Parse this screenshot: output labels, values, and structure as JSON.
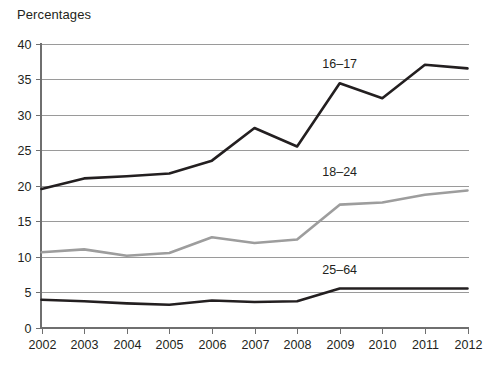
{
  "chart_data": {
    "type": "line",
    "title": "Percentages",
    "xlabel": "",
    "ylabel": "Percentages",
    "x": [
      2002,
      2003,
      2004,
      2005,
      2006,
      2007,
      2008,
      2009,
      2010,
      2011,
      2012
    ],
    "xtick_labels": [
      "2002",
      "2003",
      "2004",
      "2005",
      "2006",
      "2007",
      "2008",
      "2009",
      "2010",
      "2011",
      "2012"
    ],
    "ytick_labels": [
      "0",
      "5",
      "10",
      "15",
      "20",
      "25",
      "30",
      "35",
      "40"
    ],
    "yticks": [
      0,
      5,
      10,
      15,
      20,
      25,
      30,
      35,
      40
    ],
    "ylim": [
      0,
      40
    ],
    "xlim": [
      2002,
      2012
    ],
    "grid": true,
    "legend_position": "inline-right",
    "series": [
      {
        "name": "16–17",
        "color": "#231f20",
        "stroke_width": 2.6,
        "label_x": 2009,
        "label_y": 36.6,
        "values": [
          19.5,
          21.0,
          21.3,
          21.7,
          23.5,
          28.1,
          25.5,
          34.4,
          32.3,
          37.0,
          36.5
        ]
      },
      {
        "name": "18–24",
        "color": "#9d9d9d",
        "stroke_width": 2.6,
        "label_x": 2009,
        "label_y": 21.4,
        "values": [
          10.6,
          11.0,
          10.1,
          10.5,
          12.7,
          11.9,
          12.4,
          17.3,
          17.6,
          18.7,
          19.3
        ]
      },
      {
        "name": "25–64",
        "color": "#231f20",
        "stroke_width": 2.6,
        "label_x": 2009,
        "label_y": 7.6,
        "values": [
          3.9,
          3.7,
          3.4,
          3.2,
          3.8,
          3.6,
          3.7,
          5.5,
          5.5,
          5.5,
          5.5
        ]
      }
    ]
  }
}
